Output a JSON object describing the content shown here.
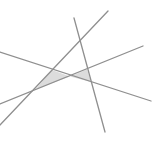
{
  "canvas": {
    "width": 154,
    "height": 153,
    "background": "#ffffff"
  },
  "style": {
    "line_color": "#8f8f8f",
    "line_width": 1.3,
    "fill_color": "#dcdcdc"
  },
  "lines": [
    {
      "id": "line-a",
      "x1": 108,
      "y1": 11,
      "x2": 0,
      "y2": 125
    },
    {
      "id": "line-b",
      "x1": 74,
      "y1": 18,
      "x2": 105,
      "y2": 132
    },
    {
      "id": "line-c",
      "x1": 0,
      "y1": 52,
      "x2": 151,
      "y2": 101
    },
    {
      "id": "line-d",
      "x1": 0,
      "y1": 104,
      "x2": 143,
      "y2": 46
    }
  ],
  "shaded_regions": [
    {
      "id": "left-triangle",
      "points": "52,70 70,76.5 36,89"
    },
    {
      "id": "right-triangle",
      "points": "70,76.5 87,69.5 91,82"
    }
  ]
}
